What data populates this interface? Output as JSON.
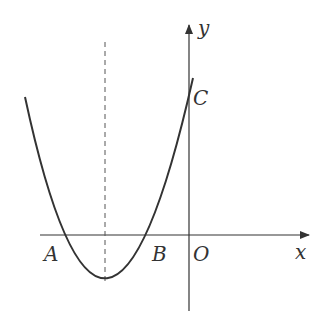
{
  "labels": {
    "y": "y",
    "x": "x",
    "C": "C",
    "A": "A",
    "B": "B",
    "O": "O"
  },
  "colors": {
    "stroke": "#333333",
    "background": "#ffffff"
  }
}
